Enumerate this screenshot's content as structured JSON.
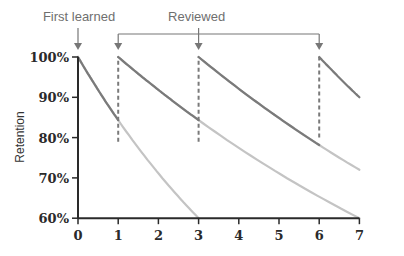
{
  "chart_data": {
    "type": "line",
    "title": "",
    "xlabel": "",
    "ylabel": "Retention",
    "x_ticks": [
      "0",
      "1",
      "2",
      "3",
      "4",
      "5",
      "6",
      "7"
    ],
    "y_ticks": [
      "60%",
      "70%",
      "80%",
      "90%",
      "100%"
    ],
    "xlim": [
      0,
      7
    ],
    "ylim": [
      60,
      100
    ],
    "grid": false,
    "annotations": [
      {
        "text": "First learned",
        "points_to_x": [
          0
        ]
      },
      {
        "text": "Reviewed",
        "points_to_x": [
          1,
          3,
          6
        ]
      }
    ],
    "series": [
      {
        "name": "Forgetting curve after first learning",
        "start_x": 0,
        "reviewed_at": 1,
        "x": [
          0,
          0.5,
          1,
          2,
          3
        ],
        "y": [
          100,
          89,
          79,
          69,
          60
        ]
      },
      {
        "name": "Forgetting curve after review at day 1",
        "start_x": 1,
        "reviewed_at": 3,
        "x": [
          1,
          2,
          3,
          5,
          7
        ],
        "y": [
          100,
          89,
          79,
          69,
          60
        ]
      },
      {
        "name": "Forgetting curve after review at day 3",
        "start_x": 3,
        "reviewed_at": 6,
        "x": [
          3,
          4.5,
          6,
          7
        ],
        "y": [
          100,
          89,
          80,
          72
        ]
      },
      {
        "name": "Forgetting curve after review at day 6",
        "start_x": 6,
        "reviewed_at": null,
        "x": [
          6,
          6.5,
          7
        ],
        "y": [
          100,
          94,
          90
        ]
      }
    ],
    "review_drops": [
      {
        "x": 1,
        "from": 79,
        "to": 100
      },
      {
        "x": 3,
        "from": 79,
        "to": 100
      },
      {
        "x": 6,
        "from": 80,
        "to": 100
      }
    ],
    "colors": {
      "active": "#7a7a7a",
      "faded": "#c4c4c4",
      "axis": "#2a2a2a",
      "annotation": "#777777"
    }
  },
  "labels": {
    "first_learned": "First learned",
    "reviewed": "Reviewed",
    "ylabel": "Retention"
  }
}
